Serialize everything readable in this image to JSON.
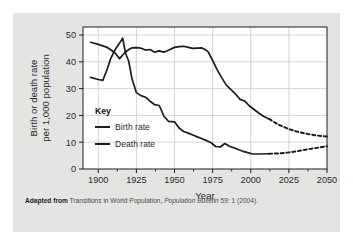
{
  "figure": {
    "caption_lead": "Adapted from",
    "caption_rest_1": " Transitions in World Population, ",
    "caption_italic": "Population Bulletin",
    "caption_rest_2": " 59: 1 (2004)."
  },
  "chart_data": {
    "type": "line",
    "title": "",
    "xlabel": "Year",
    "ylabel": "Birth or death rate\nper 1,000 population",
    "ylabel_line1": "Birth or death rate",
    "ylabel_line2": "per 1,000 population",
    "xlim": [
      1890,
      2050
    ],
    "ylim": [
      0,
      53
    ],
    "xticks": [
      1900,
      1925,
      1950,
      1975,
      2000,
      2025,
      2050
    ],
    "xtick_labels": [
      "1900",
      "1925",
      "1950",
      "1975",
      "2000",
      "2025",
      "2050"
    ],
    "xminor_ticks": [
      1912.5,
      1937.5,
      1962.5,
      1987.5,
      2012.5,
      2037.5
    ],
    "yticks": [
      0,
      10,
      20,
      30,
      40,
      50
    ],
    "ytick_labels": [
      "0",
      "10",
      "20",
      "30",
      "40",
      "50"
    ],
    "grid": true,
    "grid_color": "#c9c9c7",
    "line_color": "#1c1c1c",
    "legend_position": "inside-left",
    "legend_title": "Key",
    "series": [
      {
        "name": "Birth rate",
        "style": "solid",
        "x": [
          1895,
          1900,
          1905,
          1908,
          1911,
          1914,
          1917,
          1920,
          1922,
          1925,
          1928,
          1931,
          1934,
          1937,
          1940,
          1943,
          1946,
          1950,
          1953,
          1956,
          1959,
          1962,
          1965,
          1968,
          1970,
          1972,
          1975,
          1978,
          1981,
          1984,
          1987,
          1990,
          1993,
          1996,
          1999,
          2002,
          2005,
          2008,
          2012
        ],
        "y": [
          47.3,
          46.5,
          45.6,
          44.6,
          43.3,
          41.2,
          43.2,
          44.6,
          45.2,
          45.3,
          45.1,
          44.4,
          44.6,
          43.6,
          44.1,
          43.6,
          44.3,
          45.4,
          45.7,
          45.8,
          45.4,
          45.0,
          45.1,
          45.2,
          44.6,
          43.8,
          40.5,
          37.0,
          34.0,
          31.3,
          29.6,
          28.0,
          26.0,
          25.4,
          23.6,
          22.3,
          21.0,
          19.8,
          18.7
        ]
      },
      {
        "name": "Birth rate (projected)",
        "style": "dashed",
        "x": [
          2012,
          2018,
          2024,
          2030,
          2036,
          2042,
          2050
        ],
        "y": [
          18.7,
          16.6,
          15.1,
          14.0,
          13.2,
          12.6,
          12.1
        ]
      },
      {
        "name": "Death rate",
        "style": "solid",
        "x": [
          1895,
          1900,
          1903,
          1906,
          1908,
          1911,
          1914,
          1916,
          1918,
          1920,
          1922,
          1925,
          1928,
          1931,
          1934,
          1937,
          1940,
          1943,
          1946,
          1950,
          1953,
          1956,
          1959,
          1962,
          1965,
          1968,
          1971,
          1974,
          1977,
          1980,
          1983,
          1986,
          1989,
          1992,
          1995,
          1998,
          2001,
          2005,
          2012
        ],
        "y": [
          34.2,
          33.4,
          33.1,
          37.5,
          41.0,
          44.5,
          47.0,
          48.8,
          43.0,
          40.2,
          34.0,
          28.5,
          27.4,
          26.8,
          25.3,
          24.0,
          23.7,
          19.8,
          17.8,
          17.6,
          15.3,
          14.0,
          13.4,
          12.7,
          12.0,
          11.3,
          10.6,
          9.8,
          8.4,
          8.2,
          9.5,
          8.5,
          7.9,
          7.2,
          6.6,
          6.1,
          5.6,
          5.6,
          5.7
        ]
      },
      {
        "name": "Death rate (projected)",
        "style": "dashed",
        "x": [
          2012,
          2018,
          2024,
          2030,
          2036,
          2042,
          2050
        ],
        "y": [
          5.7,
          5.8,
          6.1,
          6.6,
          7.2,
          7.8,
          8.5
        ]
      }
    ],
    "legend_entries": [
      "Birth rate",
      "Death rate"
    ]
  }
}
